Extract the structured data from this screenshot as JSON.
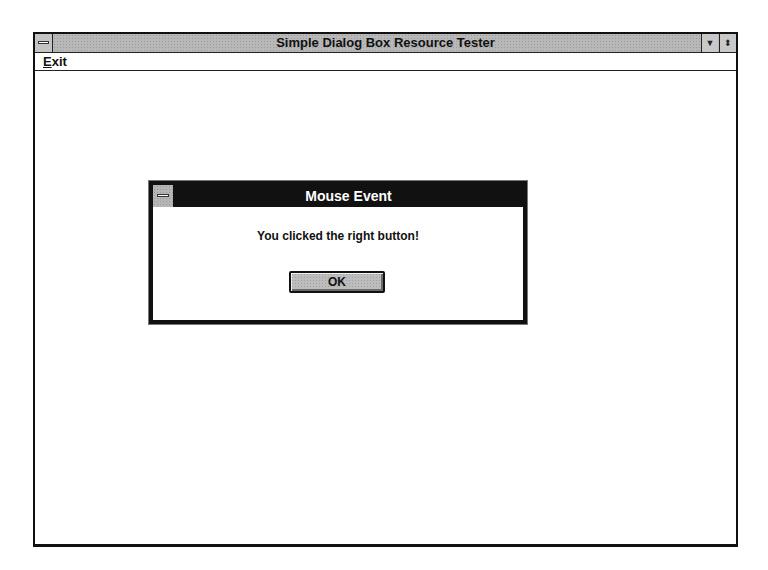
{
  "main_window": {
    "title": "Simple Dialog Box Resource Tester",
    "title_buttons": {
      "minimize_glyph": "▼",
      "restore_glyph": "⬍"
    },
    "menu": {
      "items": [
        {
          "label_mnemonic": "E",
          "label_rest": "xit"
        }
      ]
    }
  },
  "dialog": {
    "title": "Mouse Event",
    "message": "You clicked the right button!",
    "ok_label": "OK"
  },
  "colors": {
    "title_bar_inactive": "#b8b8b8",
    "dialog_title_active": "#111111",
    "button_face": "#bdbdbd",
    "window_background": "#ffffff"
  }
}
